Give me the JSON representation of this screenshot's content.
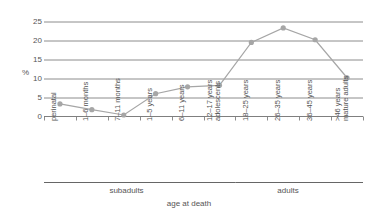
{
  "chart_data": {
    "type": "line",
    "title": "",
    "xlabel": "age at death",
    "ylabel": "%",
    "ylim": [
      0,
      25
    ],
    "yticks": [
      0,
      5,
      10,
      15,
      20,
      25
    ],
    "grid": true,
    "legend": "none",
    "categories": [
      "perinatal",
      "1–6 months",
      "7–11 months",
      "1–5 years",
      "6–11 years",
      "12–17 years adolescents",
      "18–25 years",
      "26–35 years",
      "36–45 years",
      ">46 years mature adults"
    ],
    "values": [
      3.3,
      1.8,
      0.4,
      6.0,
      7.8,
      8.2,
      19.5,
      23.3,
      20.2,
      10.2
    ],
    "series_color": "#a6a6a6",
    "marker_color": "#a6a6a6",
    "grid_color": "#7f7f7f",
    "groups": [
      {
        "label": "subadults",
        "from": 0,
        "to": 5
      },
      {
        "label": "adults",
        "from": 6,
        "to": 9
      }
    ]
  },
  "axis": {
    "y_title": "%",
    "y_tick_labels": [
      "25",
      "20",
      "15",
      "10",
      "5",
      "0"
    ],
    "x_title": "age at death"
  },
  "x_labels": [
    "perinatal",
    "1–6 months",
    "7–11 months",
    "1–5 years",
    "6–11 years",
    "12–17 years",
    "adolescents",
    "18–25 years",
    "26–35 years",
    "36–45 years",
    ">46 years",
    "mature adults"
  ],
  "groups": {
    "subadults": "subadults",
    "adults": "adults"
  }
}
